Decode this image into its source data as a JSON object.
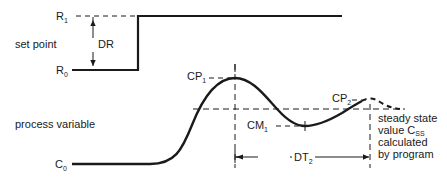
{
  "diagram": {
    "type": "step-response",
    "colors": {
      "ink": "#1a1a1a",
      "background": "#ffffff"
    },
    "set_point": {
      "label": "set point",
      "r1": {
        "main": "R",
        "sub": "1"
      },
      "r0": {
        "main": "R",
        "sub": "0"
      },
      "dr": "DR"
    },
    "process_variable": {
      "label": "process variable",
      "c0": {
        "main": "C",
        "sub": "0"
      },
      "cp1": {
        "main": "CP",
        "sub": "1"
      },
      "cm1": {
        "main": "CM",
        "sub": "1"
      },
      "cp2": {
        "main": "CP",
        "sub": "2"
      },
      "dt2": {
        "main": "DT",
        "sub": "2"
      }
    },
    "steady_state": {
      "line1": "steady state",
      "line2_main": "value C",
      "line2_sub": "SS",
      "line3": "calculated",
      "line4": "by program"
    }
  }
}
